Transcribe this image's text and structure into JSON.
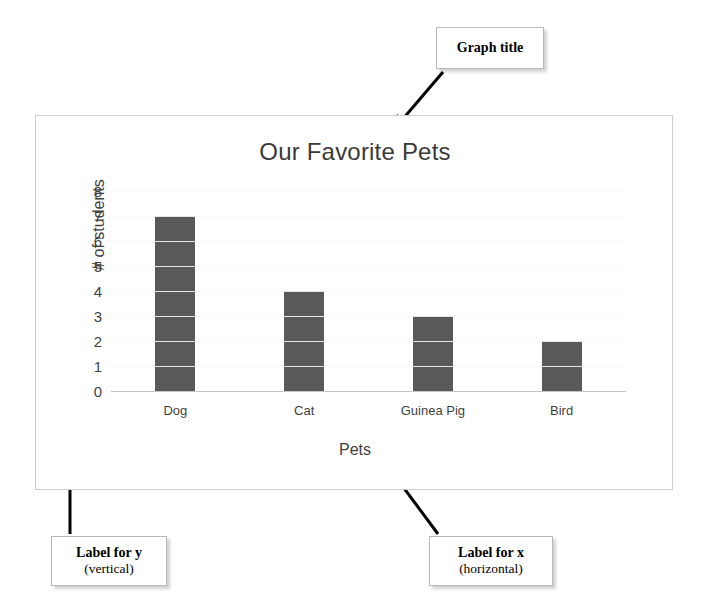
{
  "chart_data": {
    "type": "bar",
    "title": "Our Favorite Pets",
    "xlabel": "Pets",
    "ylabel": "# of students",
    "categories": [
      "Dog",
      "Cat",
      "Guinea Pig",
      "Bird"
    ],
    "values": [
      7,
      4,
      3,
      2
    ],
    "yticks": [
      8,
      7,
      6,
      5,
      4,
      3,
      2,
      1,
      0
    ],
    "ylim": [
      0,
      8
    ],
    "grid": true,
    "legend": "none",
    "bar_color": "#595959",
    "gridline_color": "#d4d4d4"
  },
  "annotations": {
    "graph_title": {
      "title": "Graph title",
      "sub": ""
    },
    "label_y": {
      "title": "Label for y",
      "sub": "(vertical)"
    },
    "label_x": {
      "title": "Label for x",
      "sub": "(horizontal)"
    }
  }
}
